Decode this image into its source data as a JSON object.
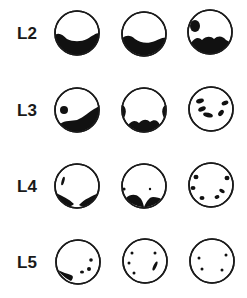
{
  "figure": {
    "rows": [
      {
        "label": "L2",
        "sections": [
          {
            "id": "L2-a",
            "pattern": "crescent-bottom"
          },
          {
            "id": "L2-b",
            "pattern": "crescent-bottom-left-bulge"
          },
          {
            "id": "L2-c",
            "pattern": "wavy-bottom-with-upper-left-spot"
          }
        ]
      },
      {
        "label": "L3",
        "sections": [
          {
            "id": "L3-a",
            "pattern": "rising-band-with-left-spot"
          },
          {
            "id": "L3-b",
            "pattern": "side-lobes-and-wavy-bottom"
          },
          {
            "id": "L3-c",
            "pattern": "scattered-flecks"
          }
        ]
      },
      {
        "label": "L4",
        "sections": [
          {
            "id": "L4-a",
            "pattern": "bottom-lobes-with-left-streak"
          },
          {
            "id": "L4-b",
            "pattern": "bottom-double-lobe-with-dot"
          },
          {
            "id": "L4-c",
            "pattern": "peripheral-ring-of-spots"
          }
        ]
      },
      {
        "label": "L5",
        "sections": [
          {
            "id": "L5-a",
            "pattern": "lower-left-streak-with-right-dots"
          },
          {
            "id": "L5-b",
            "pattern": "sparse-dots-with-streak"
          },
          {
            "id": "L5-c",
            "pattern": "four-sparse-dots"
          }
        ]
      }
    ]
  }
}
